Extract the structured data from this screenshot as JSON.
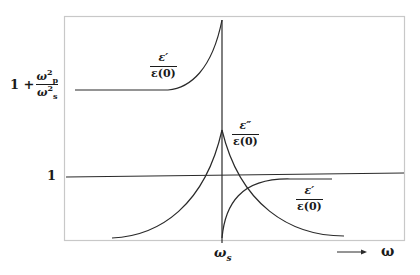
{
  "diagram": {
    "type": "dielectric-resonance-plot",
    "colors": {
      "frame": "#c8c8c8",
      "curve": "#2a2a2a",
      "text": "#1a1a1a"
    }
  },
  "y_axis": {
    "top_label": {
      "lead": "1 +",
      "num_base": "ω",
      "num_sub": "p",
      "num_sup": "2",
      "den_base": "ω",
      "den_sub": "s",
      "den_sup": "2"
    },
    "unity_label": "1"
  },
  "x_axis": {
    "resonance_label": {
      "base": "ω",
      "sub": "s"
    },
    "arrow_label": "ω",
    "arrow": "→"
  },
  "curve_labels": {
    "eps_real_low": {
      "num": "ε′",
      "den": "ε(0)"
    },
    "eps_imag": {
      "num": "ε″",
      "den": "ε(0)"
    },
    "eps_real_high": {
      "num": "ε′",
      "den": "ε(0)"
    }
  }
}
